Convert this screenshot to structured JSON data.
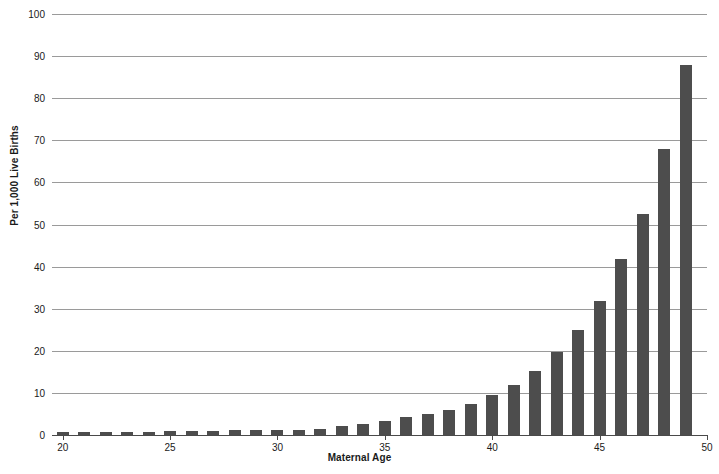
{
  "chart_data": {
    "type": "bar",
    "title": "",
    "xlabel": "Maternal Age",
    "ylabel": "Per 1,000 Live Births",
    "xlim": [
      19.5,
      50
    ],
    "ylim": [
      0,
      100
    ],
    "grid": true,
    "legend": false,
    "bar_color": "#4d4d4d",
    "grid_color": "#9a9a9a",
    "axis_color": "#4a4a4a",
    "xtick_labels": [
      "20",
      "25",
      "30",
      "35",
      "40",
      "45",
      "50"
    ],
    "xtick_values": [
      20,
      25,
      30,
      35,
      40,
      45,
      50
    ],
    "ytick_labels": [
      "0",
      "10",
      "20",
      "30",
      "40",
      "50",
      "60",
      "70",
      "80",
      "90",
      "100"
    ],
    "ytick_values": [
      0,
      10,
      20,
      30,
      40,
      50,
      60,
      70,
      80,
      90,
      100
    ],
    "categories": [
      20,
      21,
      22,
      23,
      24,
      25,
      26,
      27,
      28,
      29,
      30,
      31,
      32,
      33,
      34,
      35,
      36,
      37,
      38,
      39,
      40,
      41,
      42,
      43,
      44,
      45,
      46,
      47,
      48,
      49
    ],
    "values": [
      0.6,
      0.6,
      0.6,
      0.6,
      0.8,
      0.9,
      1.0,
      1.0,
      1.1,
      1.1,
      1.2,
      1.3,
      1.5,
      2.2,
      2.7,
      3.4,
      4.3,
      4.9,
      6.0,
      7.4,
      9.5,
      11.8,
      15.2,
      19.7,
      25.0,
      31.8,
      41.8,
      52.4,
      68.0,
      88.0
    ]
  },
  "figure": {
    "width": 719,
    "height": 474
  }
}
